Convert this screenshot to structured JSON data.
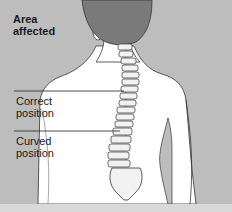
{
  "diagram": {
    "title": "Area affected",
    "title_line1": "Area",
    "title_line2": "affected",
    "labels": [
      {
        "line1": "Correct",
        "line2": "position"
      },
      {
        "line1": "Curved",
        "line2": "position"
      }
    ],
    "colors": {
      "background": "#bdbdbd",
      "body": "#ffffff",
      "hair": "#7a7a7a",
      "outline": "#333333",
      "bone": "#f2f2f2"
    }
  }
}
